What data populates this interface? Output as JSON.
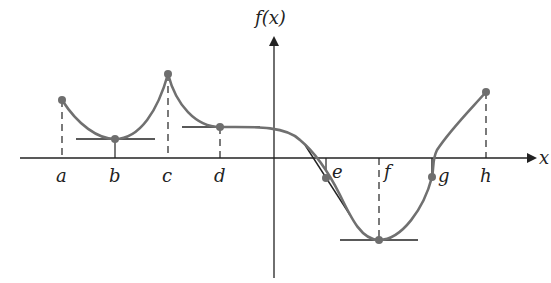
{
  "diagram": {
    "y_axis_label": "f(x)",
    "x_axis_label": "x",
    "colors": {
      "curve": "#707070",
      "axis": "#222222",
      "tangent": "#222222",
      "point": "#6e6e6e"
    },
    "points": [
      {
        "label": "a",
        "x": 62,
        "y": 100,
        "dashed": true,
        "tangent": null
      },
      {
        "label": "b",
        "x": 115,
        "y": 139,
        "dashed": false,
        "tangent": "horizontal"
      },
      {
        "label": "c",
        "x": 168,
        "y": 74,
        "dashed": true,
        "tangent": null
      },
      {
        "label": "d",
        "x": 220,
        "y": 127,
        "dashed": true,
        "tangent": "horizontal"
      },
      {
        "label": "e",
        "x": 326,
        "y": 178,
        "dashed": false,
        "tangent": "inflection"
      },
      {
        "label": "f",
        "x": 379,
        "y": 240,
        "dashed": true,
        "tangent": "horizontal"
      },
      {
        "label": "g",
        "x": 432,
        "y": 177,
        "dashed": false,
        "tangent": "vertical"
      },
      {
        "label": "h",
        "x": 486,
        "y": 92,
        "dashed": true,
        "tangent": null
      }
    ]
  }
}
